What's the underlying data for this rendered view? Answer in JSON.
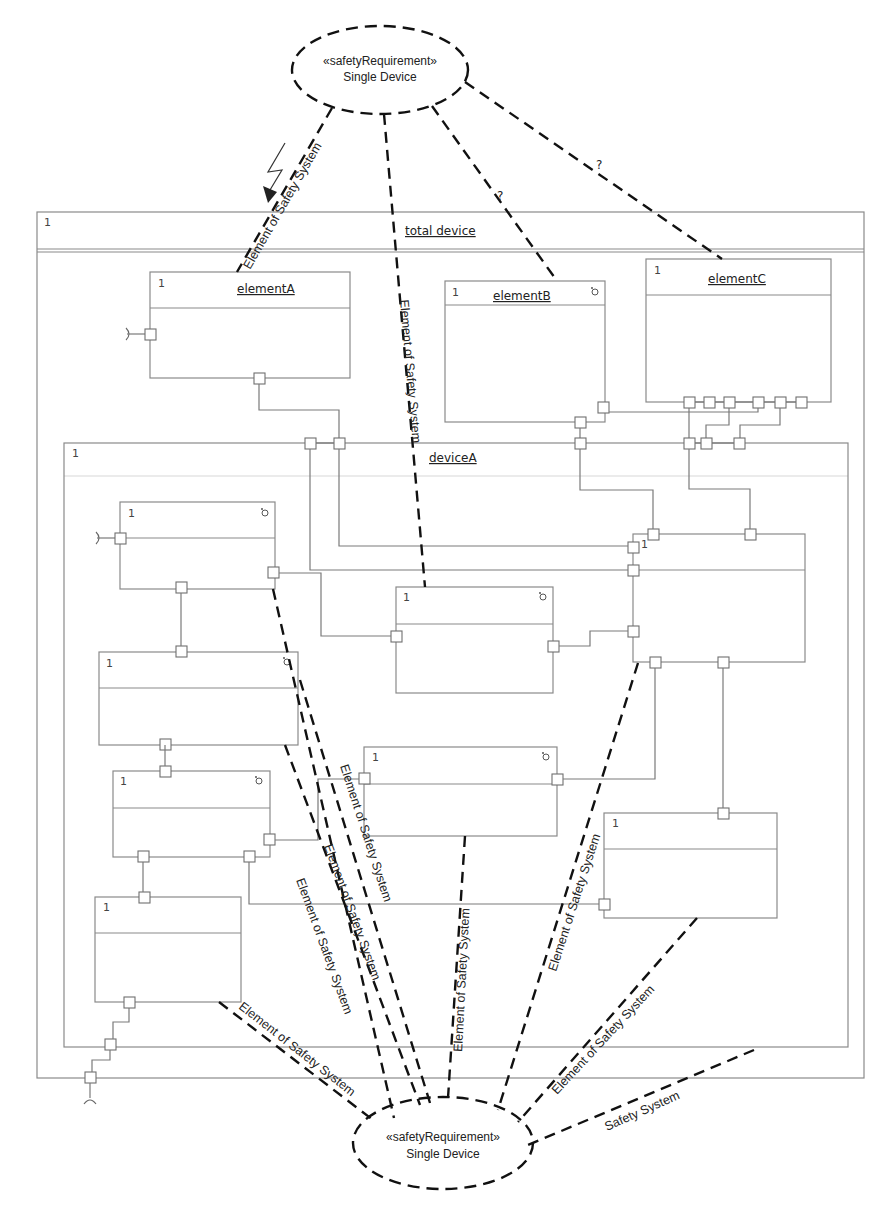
{
  "diagram": {
    "type": "UML composite structure diagram",
    "requirements": {
      "top": {
        "stereotype": "«safetyRequirement»",
        "name": "Single Device"
      },
      "bottom": {
        "stereotype": "«safetyRequirement»",
        "name": "Single Device"
      }
    },
    "frames": {
      "total_device": {
        "title": "total device",
        "multiplicity": "1"
      },
      "deviceA": {
        "title": "deviceA",
        "multiplicity": "1"
      }
    },
    "elements": {
      "elementA": {
        "title": "elementA",
        "multiplicity": "1"
      },
      "elementB": {
        "title": "elementB",
        "multiplicity": "1",
        "icon": "component-icon"
      },
      "elementC": {
        "title": "elementC",
        "multiplicity": "1"
      }
    },
    "inner_parts": [
      {
        "id": "part1",
        "multiplicity": "1",
        "icon": "component-icon"
      },
      {
        "id": "part2",
        "multiplicity": "1",
        "icon": "component-icon"
      },
      {
        "id": "part3",
        "multiplicity": "1",
        "icon": "component-icon"
      },
      {
        "id": "part4",
        "multiplicity": "1"
      },
      {
        "id": "part5",
        "multiplicity": "1",
        "icon": "component-icon"
      },
      {
        "id": "part6",
        "multiplicity": "1",
        "icon": "component-icon"
      },
      {
        "id": "part7",
        "multiplicity": "1"
      },
      {
        "id": "part8",
        "multiplicity": "1"
      }
    ],
    "edge_labels": {
      "element_of_safety_system": "Element of Safety System",
      "safety_system": "Safety System",
      "unknown": "?"
    },
    "symbols": {
      "lightning": "lightning-bolt-icon"
    }
  }
}
